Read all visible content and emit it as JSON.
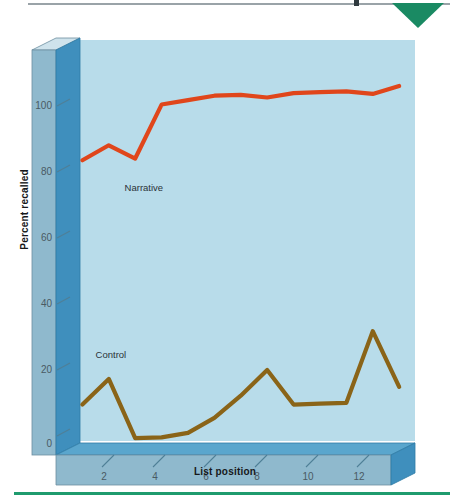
{
  "page": {
    "header_marker": "header-rule",
    "footer_marker": "footer-rule",
    "accent_green": "#1f9b6e"
  },
  "figure": {
    "y_axis_title": "Percent recalled",
    "x_axis_title": "List position",
    "plot_bg": "#b8dcea",
    "axis_face": "#8fb9cd",
    "axis_side": "#3f8fbd",
    "axis_top": "#cfe3ec"
  },
  "chart_data": {
    "type": "line",
    "title": "",
    "subtitle": "",
    "xlabel": "List position",
    "ylabel": "Percent recalled",
    "xlim": [
      0,
      13.6
    ],
    "ylim": [
      0,
      108
    ],
    "grid": false,
    "legend_position": "inline-annotation",
    "xticks": [
      2,
      4,
      6,
      8,
      10,
      12
    ],
    "xtick_labels": [
      "2",
      "4",
      "6",
      "8",
      "10",
      "12"
    ],
    "yticks": [
      0,
      20,
      40,
      60,
      80,
      100
    ],
    "ytick_labels": [
      "0",
      "20",
      "40",
      "60",
      "80",
      "100"
    ],
    "x": [
      1,
      2,
      3,
      4,
      5,
      6,
      7,
      8,
      9,
      10,
      11,
      12,
      13
    ],
    "series": [
      {
        "name": "Narrative",
        "color": "#e0461b",
        "label_x": 2.6,
        "label_y": 74,
        "values": [
          83,
          87,
          83,
          98,
          99,
          100,
          100,
          99,
          100,
          100,
          100,
          99,
          101
        ]
      },
      {
        "name": "Control",
        "color": "#8a6418",
        "label_x": 1.5,
        "label_y": 27,
        "values": [
          14,
          21,
          4,
          4,
          5,
          9,
          15,
          22,
          12,
          12,
          12,
          32,
          16
        ]
      }
    ],
    "annotations": [
      {
        "text": "Narrative",
        "x": 2.6,
        "y": 74
      },
      {
        "text": "Control",
        "x": 1.5,
        "y": 27
      }
    ]
  }
}
